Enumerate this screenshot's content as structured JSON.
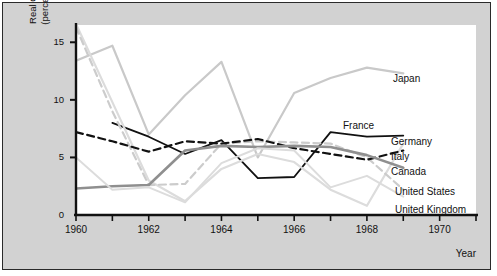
{
  "axes": {
    "y_title_line1": "Real GNP growth",
    "y_title_line2": "(percent per year)",
    "x_title": "Year",
    "y_ticks": [
      "0",
      "5",
      "10",
      "15"
    ],
    "y_tick_values": [
      0,
      5,
      10,
      15
    ],
    "x_ticks": [
      "1960",
      "1962",
      "1964",
      "1966",
      "1968",
      "1970"
    ],
    "x_tick_values": [
      1960,
      1962,
      1964,
      1966,
      1968,
      1970
    ]
  },
  "labels": {
    "japan": "Japan",
    "france": "France",
    "germany": "Germany",
    "italy": "Italy",
    "canada": "Canada",
    "united_states": "United States",
    "united_kingdom": "United Kingdom"
  },
  "colors": {
    "background": "#d2d2d2",
    "plot_background": "#ffffff",
    "frame": "#2a2a2a",
    "axis": "#111111",
    "black_solid": "#111111",
    "black_dashed": "#111111",
    "mid_gray": "#8f8f8f",
    "light_gray": "#c9c9c9",
    "light_gray_dashed": "#cccccc",
    "pale_gray": "#dcdcdc"
  },
  "chart_data": {
    "type": "line",
    "title": "",
    "xlabel": "Year",
    "ylabel": "Real GNP growth (percent per year)",
    "xlim": [
      1960,
      1971
    ],
    "ylim": [
      0,
      16.5
    ],
    "grid": false,
    "legend": "inline-right-of-line-ends",
    "x": [
      1960,
      1961,
      1962,
      1963,
      1964,
      1965,
      1966,
      1967,
      1968,
      1969
    ],
    "series": [
      {
        "name": "Japan",
        "color": "#c9c9c9",
        "style": "solid",
        "width": 2.2,
        "values": [
          13.4,
          14.7,
          7.0,
          10.4,
          13.3,
          5.0,
          10.6,
          11.9,
          12.8,
          12.3
        ]
      },
      {
        "name": "France",
        "color": "#111111",
        "style": "solid",
        "width": 1.8,
        "values": [
          null,
          8.0,
          6.8,
          5.3,
          6.5,
          3.2,
          3.3,
          7.2,
          6.8,
          6.9
        ]
      },
      {
        "name": "Germany",
        "color": "#dcdcdc",
        "style": "solid",
        "width": 2.2,
        "values": [
          16.6,
          9.8,
          3.0,
          1.2,
          4.0,
          5.3,
          4.6,
          2.2,
          0.8,
          6.2
        ]
      },
      {
        "name": "Italy",
        "color": "#cccccc",
        "style": "dashed",
        "width": 2.2,
        "values": [
          16.3,
          9.0,
          2.6,
          2.7,
          6.2,
          6.4,
          6.3,
          6.2,
          5.0,
          2.2
        ]
      },
      {
        "name": "Canada",
        "color": "#111111",
        "style": "dashed",
        "width": 2.2,
        "values": [
          7.2,
          6.4,
          5.5,
          6.4,
          6.2,
          6.6,
          5.8,
          5.3,
          4.8,
          5.6
        ]
      },
      {
        "name": "United States",
        "color": "#8f8f8f",
        "style": "solid",
        "width": 2.6,
        "values": [
          2.3,
          2.5,
          2.6,
          5.6,
          6.0,
          5.9,
          6.0,
          5.9,
          5.2,
          4.1
        ]
      },
      {
        "name": "United Kingdom",
        "color": "#dcdcdc",
        "style": "solid",
        "width": 2.0,
        "values": [
          5.0,
          2.2,
          2.4,
          1.1,
          4.5,
          5.8,
          5.6,
          2.4,
          3.4,
          1.6
        ]
      }
    ]
  }
}
